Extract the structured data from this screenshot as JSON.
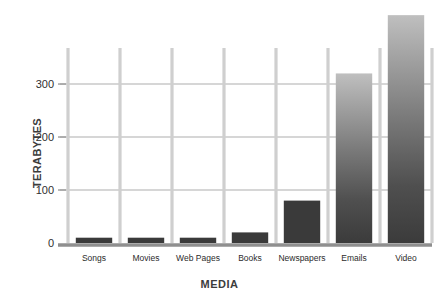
{
  "chart_data": {
    "type": "bar",
    "title": "",
    "subtitle": "",
    "xlabel": "MEDIA",
    "ylabel": "TERABYTES",
    "categories": [
      "Songs",
      "Movies",
      "Web Pages",
      "Books",
      "Newspapers",
      "Emails",
      "Video"
    ],
    "values": [
      10,
      10,
      10,
      20,
      80,
      320,
      430
    ],
    "ylim": [
      0,
      368
    ],
    "yticks": [
      0,
      100,
      200,
      300
    ],
    "ytick_labels": [
      "0",
      "100",
      "200",
      "300"
    ],
    "grid": "horizontal-and-vertical",
    "legend": "none",
    "bar_styles": [
      "solid",
      "solid",
      "solid",
      "solid",
      "solid",
      "gradient",
      "gradient"
    ],
    "colors": {
      "bar_solid": "#3a3a3a",
      "bar_gradient_top": "#b5b5b5",
      "bar_gradient_bottom": "#3a3a3a",
      "gridline": "#c9c9c9",
      "vertical_gridline": "#cfcfcf",
      "axis": "#8f8f8f",
      "text": "#2f2f2f",
      "background": "#ffffff"
    }
  },
  "axes": {
    "y_title": "TERABYTES",
    "x_title": "MEDIA"
  }
}
